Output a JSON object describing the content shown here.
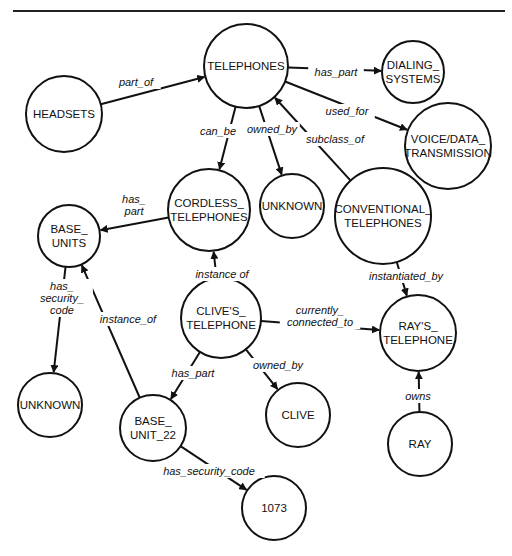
{
  "diagram": {
    "type": "semantic-network",
    "top_rule": {
      "x1": 13,
      "x2": 505,
      "y": 11
    },
    "nodes": [
      {
        "id": "telephones",
        "lines": [
          "TELEPHONES"
        ],
        "cx": 246,
        "cy": 66,
        "r": 42
      },
      {
        "id": "headsets",
        "lines": [
          "HEADSETS"
        ],
        "cx": 64,
        "cy": 114,
        "r": 38
      },
      {
        "id": "dialing_systems",
        "lines": [
          "DIALING_",
          "SYSTEMS"
        ],
        "cx": 413,
        "cy": 72,
        "r": 31
      },
      {
        "id": "voice_data_transmission",
        "lines": [
          "VOICE/DATA_",
          "TRANSMISSION"
        ],
        "cx": 448,
        "cy": 146,
        "r": 43
      },
      {
        "id": "cordless_telephones",
        "lines": [
          "CORDLESS_",
          "TELEPHONES"
        ],
        "cx": 209,
        "cy": 210,
        "r": 41
      },
      {
        "id": "unknown_1",
        "lines": [
          "UNKNOWN"
        ],
        "cx": 292,
        "cy": 206,
        "r": 32
      },
      {
        "id": "conventional_telephones",
        "lines": [
          "CONVENTIONAL_",
          "TELEPHONES"
        ],
        "cx": 383,
        "cy": 216,
        "r": 48
      },
      {
        "id": "base_units",
        "lines": [
          "BASE_",
          "UNITS"
        ],
        "cx": 69,
        "cy": 236,
        "r": 31
      },
      {
        "id": "clives_telephone",
        "lines": [
          "CLIVE'S_",
          "TELEPHONE"
        ],
        "cx": 221,
        "cy": 318,
        "r": 40
      },
      {
        "id": "rays_telephone",
        "lines": [
          "RAY'S_",
          "TELEPHONE"
        ],
        "cx": 418,
        "cy": 333,
        "r": 38
      },
      {
        "id": "unknown_2",
        "lines": [
          "UNKNOWN"
        ],
        "cx": 50,
        "cy": 405,
        "r": 32
      },
      {
        "id": "base_unit_22",
        "lines": [
          "BASE_",
          "UNIT_22"
        ],
        "cx": 153,
        "cy": 428,
        "r": 33
      },
      {
        "id": "clive",
        "lines": [
          "CLIVE"
        ],
        "cx": 298,
        "cy": 415,
        "r": 32
      },
      {
        "id": "ray",
        "lines": [
          "RAY"
        ],
        "cx": 420,
        "cy": 444,
        "r": 32
      },
      {
        "id": "code_1073",
        "lines": [
          "1073"
        ],
        "cx": 274,
        "cy": 508,
        "r": 32
      }
    ],
    "edges": [
      {
        "from": "headsets",
        "to": "telephones",
        "label": [
          "part_of"
        ],
        "lx": 136,
        "ly": 82
      },
      {
        "from": "telephones",
        "to": "dialing_systems",
        "label": [
          "has_part"
        ],
        "lx": 336,
        "ly": 72
      },
      {
        "from": "telephones",
        "to": "voice_data_transmission",
        "label": [
          "used_for"
        ],
        "lx": 347,
        "ly": 111
      },
      {
        "from": "telephones",
        "to": "cordless_telephones",
        "label": [
          "can_be"
        ],
        "lx": 218,
        "ly": 131
      },
      {
        "from": "telephones",
        "to": "unknown_1",
        "label": [
          "owned_by"
        ],
        "lx": 272,
        "ly": 129
      },
      {
        "from": "conventional_telephones",
        "to": "telephones",
        "label": [
          "subclass_of"
        ],
        "lx": 335,
        "ly": 139
      },
      {
        "from": "cordless_telephones",
        "to": "base_units",
        "label": [
          "has_",
          "part"
        ],
        "lx": 134,
        "ly": 205
      },
      {
        "from": "base_units",
        "to": "unknown_2",
        "label": [
          "has_",
          "security_",
          "code"
        ],
        "lx": 62,
        "ly": 298
      },
      {
        "from": "base_unit_22",
        "to": "base_units",
        "label": [
          "instance_of"
        ],
        "lx": 128,
        "ly": 319
      },
      {
        "from": "clives_telephone",
        "to": "cordless_telephones",
        "label": [
          "instance of"
        ],
        "lx": 222,
        "ly": 274
      },
      {
        "from": "conventional_telephones",
        "to": "rays_telephone",
        "label": [
          "instantiated_by"
        ],
        "lx": 406,
        "ly": 276
      },
      {
        "from": "clives_telephone",
        "to": "rays_telephone",
        "label": [
          "currently_",
          "connected_to"
        ],
        "lx": 320,
        "ly": 316
      },
      {
        "from": "clives_telephone",
        "to": "base_unit_22",
        "label": [
          "has_part"
        ],
        "lx": 193,
        "ly": 373
      },
      {
        "from": "clives_telephone",
        "to": "clive",
        "label": [
          "owned_by"
        ],
        "lx": 278,
        "ly": 365
      },
      {
        "from": "ray",
        "to": "rays_telephone",
        "label": [
          "owns"
        ],
        "lx": 418,
        "ly": 396
      },
      {
        "from": "base_unit_22",
        "to": "code_1073",
        "label": [
          "has_security_code"
        ],
        "lx": 209,
        "ly": 471
      }
    ]
  }
}
